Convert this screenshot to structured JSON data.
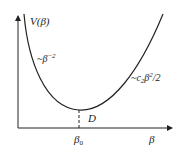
{
  "diagram": {
    "type": "potential-energy-curve",
    "labels": {
      "y_axis": "V(β)",
      "x_axis": "β",
      "minimum_point": "D",
      "minimum_x": "β",
      "minimum_x_sub": "0",
      "left_branch": "~β",
      "left_branch_exp": "−2",
      "right_branch_prefix": "~c",
      "right_branch_sub": "2",
      "right_branch_mid": "β",
      "right_branch_exp": "2",
      "right_branch_suffix": "/2"
    },
    "colors": {
      "line": "#222222",
      "background": "#ffffff"
    }
  }
}
